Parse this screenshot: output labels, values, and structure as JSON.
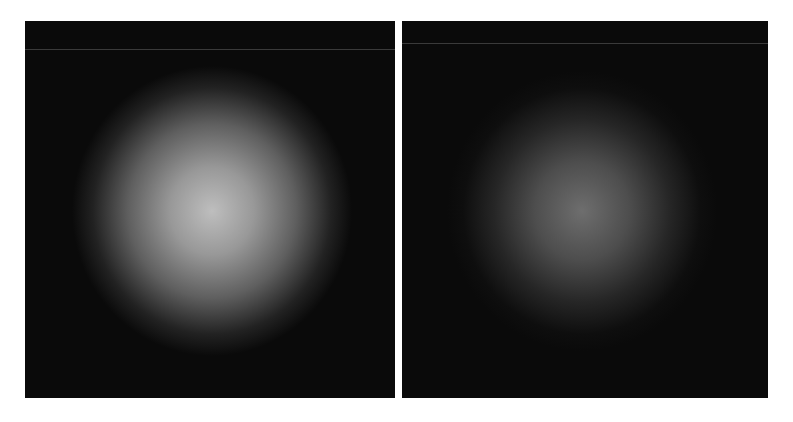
{
  "figure": {
    "panels": [
      {
        "id": "left",
        "description": "bright diffuse circular speckle pattern on black background",
        "center_brightness": "#bebebe",
        "background": "#0a0a0a"
      },
      {
        "id": "right",
        "description": "dimmer circular speckle pattern with coarse dark granular texture on black background",
        "center_brightness": "#6e6e6e",
        "background": "#0a0a0a"
      }
    ]
  }
}
